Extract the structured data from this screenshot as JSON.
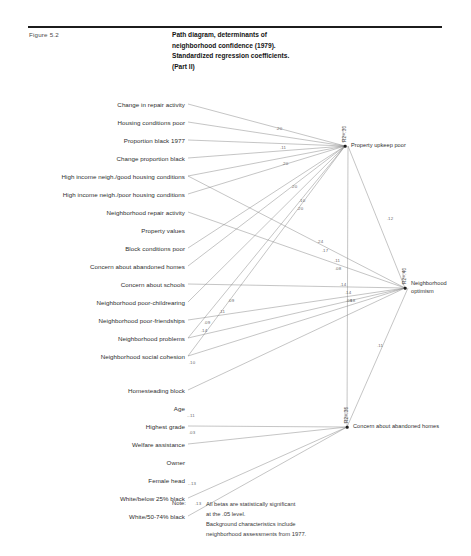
{
  "figure": {
    "number": "Figure 5.2",
    "title_lines": [
      "Path diagram, determinants of",
      "neighborhood confidence (1979).",
      "Standardized regression coefficients.",
      "(Part II)"
    ]
  },
  "note": {
    "label": "Note:",
    "lines": [
      "All betas are statistically significant",
      "at the .05 level.",
      "Background characteristics include",
      "neighborhood assessments from 1977."
    ]
  },
  "chart_data": {
    "type": "diagram",
    "title": "Path diagram, determinants of neighborhood confidence (1979). Standardized regression coefficients. (Part II)",
    "diagram_kind": "path-diagram",
    "predictors": [
      {
        "id": "p1",
        "label": "Change in repair activity",
        "x": 185,
        "y": 104
      },
      {
        "id": "p2",
        "label": "Housing conditions poor",
        "x": 185,
        "y": 122
      },
      {
        "id": "p3",
        "label": "Proportion black 1977",
        "x": 185,
        "y": 140
      },
      {
        "id": "p4",
        "label": "Change proportion black",
        "x": 185,
        "y": 158
      },
      {
        "id": "p5",
        "label": "High income neigh./good housing conditions",
        "x": 185,
        "y": 176
      },
      {
        "id": "p6",
        "label": "High income neigh./poor housing conditions",
        "x": 185,
        "y": 194
      },
      {
        "id": "p7",
        "label": "Neighborhood repair activity",
        "x": 185,
        "y": 212
      },
      {
        "id": "p8",
        "label": "Property values",
        "x": 185,
        "y": 230
      },
      {
        "id": "p9",
        "label": "Block conditions poor",
        "x": 185,
        "y": 248
      },
      {
        "id": "p10",
        "label": "Concern about abandoned homes",
        "x": 185,
        "y": 266
      },
      {
        "id": "p11",
        "label": "Concern about schools",
        "x": 185,
        "y": 284
      },
      {
        "id": "p12",
        "label": "Neighborhood poor-childrearing",
        "x": 185,
        "y": 302
      },
      {
        "id": "p13",
        "label": "Neighborhood poor-friendships",
        "x": 185,
        "y": 320
      },
      {
        "id": "p14",
        "label": "Neighborhood problems",
        "x": 185,
        "y": 338
      },
      {
        "id": "p15",
        "label": "Neighborhood social cohesion",
        "x": 185,
        "y": 356
      },
      {
        "id": "p16",
        "label": "Homesteading block",
        "x": 185,
        "y": 390
      },
      {
        "id": "p17",
        "label": "Age",
        "x": 185,
        "y": 408
      },
      {
        "id": "p18",
        "label": "Highest grade",
        "x": 185,
        "y": 426
      },
      {
        "id": "p19",
        "label": "Welfare assistance",
        "x": 185,
        "y": 444
      },
      {
        "id": "p20",
        "label": "Owner",
        "x": 185,
        "y": 462
      },
      {
        "id": "p21",
        "label": "Female head",
        "x": 185,
        "y": 480
      },
      {
        "id": "p22",
        "label": "White/below 25% black",
        "x": 185,
        "y": 498
      },
      {
        "id": "p23",
        "label": "White/50-74% black",
        "x": 185,
        "y": 516
      }
    ],
    "outcomes": [
      {
        "id": "o1",
        "label_lines": [
          "Property upkeep poor"
        ],
        "x": 345,
        "y": 146,
        "r2": "R2=.30"
      },
      {
        "id": "o2",
        "label_lines": [
          "Neighborhood",
          "optimism"
        ],
        "x": 405,
        "y": 288,
        "r2": "R2=.40"
      },
      {
        "id": "o3",
        "label_lines": [
          "Concern about abandoned homes"
        ],
        "x": 347,
        "y": 427,
        "r2": "R2=.36"
      }
    ],
    "paths": [
      {
        "from": "p1",
        "to": "o1",
        "beta": ".20",
        "lx": 279,
        "ly": 128
      },
      {
        "from": "p2",
        "to": "o1",
        "beta": ".11",
        "lx": 283,
        "ly": 147
      },
      {
        "from": "p3",
        "to": "o1",
        "beta": ".20",
        "lx": 285,
        "ly": 163
      },
      {
        "from": "p4",
        "to": "o1",
        "beta": ".20",
        "lx": 294,
        "ly": 186
      },
      {
        "from": "p5",
        "to": "o1",
        "beta": ".10",
        "lx": 302,
        "ly": 200
      },
      {
        "from": "p6",
        "to": "o1",
        "beta": ".20",
        "lx": 300,
        "ly": 208
      },
      {
        "from": "p9",
        "to": "o1",
        "beta": ".24",
        "lx": 320,
        "ly": 241
      },
      {
        "from": "p10",
        "to": "o1",
        "beta": ".17",
        "lx": 325,
        "ly": 250
      },
      {
        "from": "p12",
        "to": "o1",
        "beta": ".11",
        "lx": 337,
        "ly": 260
      },
      {
        "from": "p14",
        "to": "o1",
        "beta": ".08",
        "lx": 338,
        "ly": 268
      },
      {
        "from": "p15",
        "to": "o1",
        "beta": ".14",
        "lx": 343,
        "ly": 284
      },
      {
        "from": "o1",
        "to": "o2",
        "beta": ".12",
        "lx": 390,
        "ly": 218
      },
      {
        "from": "o1",
        "to": "o3",
        "beta": ".18",
        "lx": 352,
        "ly": 300
      },
      {
        "from": "p5",
        "to": "o2",
        "beta": ".14",
        "lx": 348,
        "ly": 292
      },
      {
        "from": "p7",
        "to": "o2",
        "beta": ".08",
        "lx": 349,
        "ly": 300
      },
      {
        "from": "p11",
        "to": "o2",
        "beta": ".09",
        "lx": 231,
        "ly": 300
      },
      {
        "from": "p13",
        "to": "o2",
        "beta": ".11",
        "lx": 222,
        "ly": 311
      },
      {
        "from": "p14",
        "to": "o2",
        "beta": ".09",
        "lx": 207,
        "ly": 322
      },
      {
        "from": "p15",
        "to": "o2",
        "beta": ".14",
        "lx": 204,
        "ly": 330
      },
      {
        "from": "p16",
        "to": "o2",
        "beta": ".10",
        "lx": 192,
        "ly": 362
      },
      {
        "from": "o2",
        "to": "o3",
        "beta": ".11",
        "lx": 380,
        "ly": 345
      },
      {
        "from": "p18",
        "to": "o3",
        "beta": "-.11",
        "lx": 191,
        "ly": 415
      },
      {
        "from": "p19",
        "to": "o3",
        "beta": ".03",
        "lx": 192,
        "ly": 432
      },
      {
        "from": "p22",
        "to": "o3",
        "beta": "-.13",
        "lx": 192,
        "ly": 483
      },
      {
        "from": "p23",
        "to": "o3",
        "beta": ".13",
        "lx": 198,
        "ly": 503
      }
    ]
  }
}
